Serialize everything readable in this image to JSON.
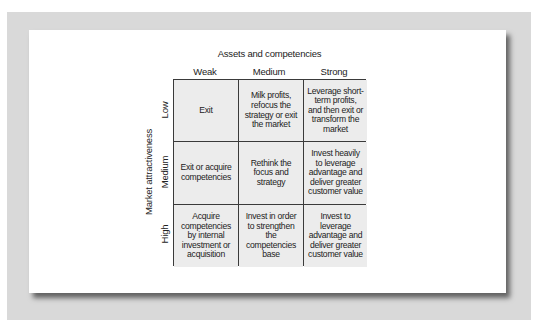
{
  "diagram": {
    "x_axis_title": "Assets and competencies",
    "y_axis_title": "Market attractiveness",
    "columns": [
      "Weak",
      "Medium",
      "Strong"
    ],
    "rows": [
      "Low",
      "Medium",
      "High"
    ],
    "cells": [
      [
        "Exit",
        "Milk profits, refocus the strategy or exit the market",
        "Leverage short-term profits, and then exit or transform the market"
      ],
      [
        "Exit or acquire competencies",
        "Rethink the focus and strategy",
        "Invest heavily to leverage advantage and deliver greater customer value"
      ],
      [
        "Acquire competencies by internal investment or acquisition",
        "Invest in order to strengthen the competencies base",
        "Invest to leverage advantage and deliver greater customer value"
      ]
    ]
  },
  "colors": {
    "frame": "#d9d9d9",
    "panel": "#ffffff",
    "cell_fill": "#ececec",
    "grid_line": "#3a3a3a"
  }
}
